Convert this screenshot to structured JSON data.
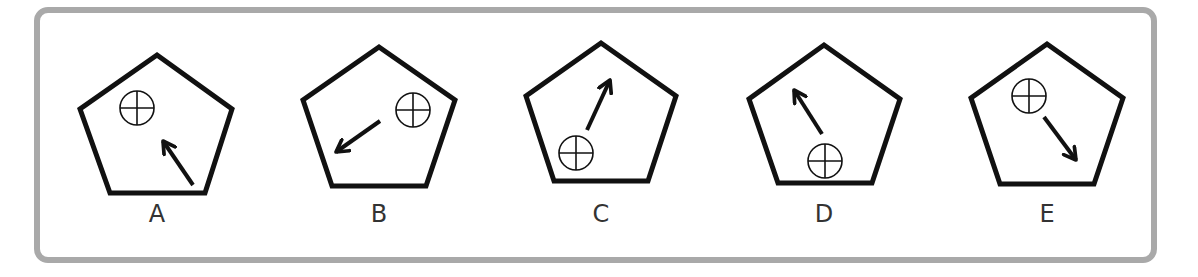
{
  "puzzle": {
    "type": "figure-sequence-options",
    "frame_color": "#a9a9a9",
    "shape_color": "#111111",
    "options": [
      {
        "label": "A",
        "pentagon": [
          [
            157,
            55
          ],
          [
            232,
            109
          ],
          [
            205,
            193
          ],
          [
            110,
            193
          ],
          [
            80,
            109
          ]
        ],
        "circle": {
          "cx": 137,
          "cy": 108,
          "r": 17
        },
        "arrow": {
          "x1": 193,
          "y1": 185,
          "x2": 163,
          "y2": 141
        },
        "label_x": 157
      },
      {
        "label": "B",
        "pentagon": [
          [
            379,
            47
          ],
          [
            455,
            100
          ],
          [
            426,
            186
          ],
          [
            332,
            186
          ],
          [
            303,
            100
          ]
        ],
        "circle": {
          "cx": 413,
          "cy": 110,
          "r": 17
        },
        "arrow": {
          "x1": 380,
          "y1": 121,
          "x2": 336,
          "y2": 152
        },
        "label_x": 379
      },
      {
        "label": "C",
        "pentagon": [
          [
            601,
            43
          ],
          [
            676,
            96
          ],
          [
            648,
            181
          ],
          [
            554,
            181
          ],
          [
            526,
            96
          ]
        ],
        "circle": {
          "cx": 576,
          "cy": 153,
          "r": 17
        },
        "arrow": {
          "x1": 587,
          "y1": 130,
          "x2": 610,
          "y2": 80
        },
        "label_x": 601
      },
      {
        "label": "D",
        "pentagon": [
          [
            824,
            45
          ],
          [
            900,
            99
          ],
          [
            872,
            183
          ],
          [
            778,
            183
          ],
          [
            749,
            99
          ]
        ],
        "circle": {
          "cx": 825,
          "cy": 161,
          "r": 17
        },
        "arrow": {
          "x1": 822,
          "y1": 134,
          "x2": 794,
          "y2": 90
        },
        "label_x": 824
      },
      {
        "label": "E",
        "pentagon": [
          [
            1047,
            44
          ],
          [
            1123,
            98
          ],
          [
            1094,
            184
          ],
          [
            1000,
            184
          ],
          [
            971,
            98
          ]
        ],
        "circle": {
          "cx": 1029,
          "cy": 96,
          "r": 17
        },
        "arrow": {
          "x1": 1044,
          "y1": 117,
          "x2": 1076,
          "y2": 160
        },
        "label_x": 1047
      }
    ]
  }
}
